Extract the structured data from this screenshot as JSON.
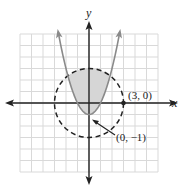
{
  "figure": {
    "type": "coordinate-graph",
    "axes": {
      "x_label": "x",
      "y_label": "y"
    },
    "grid": {
      "xmin": -6,
      "xmax": 6,
      "ymin": -6,
      "ymax": 6,
      "step": 1
    },
    "curves": [
      {
        "name": "parabola",
        "equation": "y = x^2 - 1",
        "style": "solid",
        "color": "#8a8a8a"
      },
      {
        "name": "circle",
        "equation": "x^2 + y^2 = 9",
        "style": "dashed",
        "color": "#222222"
      }
    ],
    "shaded_region": {
      "description": "inside circle, above parabola",
      "color": "#d6d6d6"
    },
    "points": [
      {
        "label": "(3, 0)",
        "x": 3,
        "y": 0
      },
      {
        "label": "(0, −1)",
        "x": 0,
        "y": -1
      }
    ]
  },
  "colors": {
    "grid": "#d9d9d9",
    "axis": "#222222",
    "parabola": "#8a8a8a",
    "shade": "#d6d6d6"
  }
}
